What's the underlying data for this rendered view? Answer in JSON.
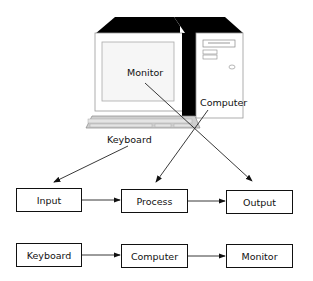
{
  "illustration": {
    "monitor_label": "Monitor",
    "computer_label": "Computer",
    "keyboard_label": "Keyboard"
  },
  "flow_abstract": {
    "boxes": [
      "Input",
      "Process",
      "Output"
    ]
  },
  "flow_concrete": {
    "boxes": [
      "Keyboard",
      "Computer",
      "Monitor"
    ]
  },
  "mappings": [
    {
      "from": "Keyboard",
      "to": "Input"
    },
    {
      "from": "Computer",
      "to": "Process"
    },
    {
      "from": "Monitor",
      "to": "Output"
    }
  ],
  "colors": {
    "stroke": "#111111",
    "shadow": "#000000",
    "panel": "#f4f4f4",
    "keyboard": "#cfcfcf"
  }
}
